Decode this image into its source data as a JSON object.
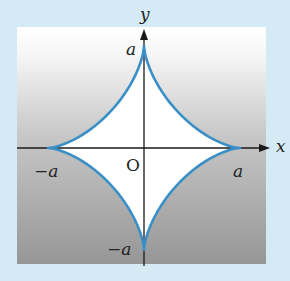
{
  "figure": {
    "equation_hint": "x^(2/3) + y^(2/3) = a^(2/3)",
    "colors": {
      "background": "#d4ebf6",
      "gradient_top": "#ffffff",
      "gradient_bottom": "#9a9a9a",
      "curve": "#3a8fc8",
      "axes": "#1a1a1a"
    },
    "axes": {
      "x_label": "x",
      "y_label": "y",
      "origin_label": "O"
    },
    "ticks": {
      "x_positive": "a",
      "x_negative": "−a",
      "y_positive": "a",
      "y_negative": "−a"
    }
  }
}
